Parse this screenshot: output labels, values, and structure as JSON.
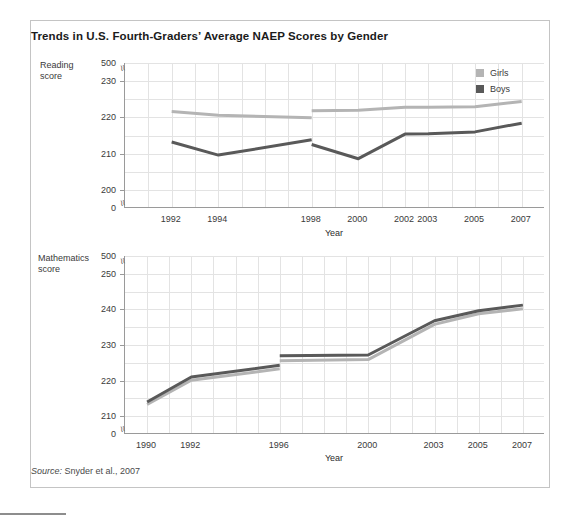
{
  "figure": {
    "title": "Trends in U.S. Fourth-Graders’ Average NAEP Scores by Gender",
    "source_label": "Source:",
    "source_text": " Snyder et al., 2007",
    "colors": {
      "girls": "#b4b4b4",
      "boys": "#595959",
      "grid": "#e3e3e3",
      "axis": "#9a9a9a",
      "frame": "#c4c4c4",
      "text": "#3a3a3a"
    }
  },
  "legend": {
    "position": "top-right",
    "items": [
      {
        "label": "Girls",
        "color": "#b4b4b4"
      },
      {
        "label": "Boys",
        "color": "#595959"
      }
    ]
  },
  "chart_data": [
    {
      "id": "reading",
      "type": "line",
      "title": "",
      "ylabel": "Reading\nscore",
      "xlabel": "Year",
      "axis_break": true,
      "grid": true,
      "ylim": [
        195,
        235
      ],
      "yticks": [
        0,
        200,
        210,
        220,
        230,
        500
      ],
      "ytick_labels": [
        "0",
        "200",
        "210",
        "220",
        "230",
        "500"
      ],
      "xlim": [
        1990,
        2008
      ],
      "xticks": [
        1992,
        1994,
        1998,
        2000,
        2002,
        2003,
        2005,
        2007
      ],
      "xtick_labels": [
        "1992",
        "1994",
        "1998",
        "2000",
        "2002",
        "2003",
        "2005",
        "2007"
      ],
      "series": [
        {
          "name": "Girls",
          "color": "#b4b4b4",
          "segments": [
            {
              "x": [
                1992,
                1994,
                1998
              ],
              "y": [
                221.6,
                220.6,
                219.9
              ]
            },
            {
              "x": [
                1998,
                2000,
                2002,
                2003,
                2005,
                2007
              ],
              "y": [
                221.8,
                222.0,
                222.8,
                222.8,
                222.9,
                224.4
              ]
            }
          ]
        },
        {
          "name": "Boys",
          "color": "#595959",
          "segments": [
            {
              "x": [
                1992,
                1994,
                1998
              ],
              "y": [
                213.2,
                209.6,
                213.8
              ]
            },
            {
              "x": [
                1998,
                2000,
                2002,
                2003,
                2005,
                2007
              ],
              "y": [
                212.5,
                208.6,
                215.4,
                215.5,
                216.0,
                218.4
              ]
            }
          ]
        }
      ]
    },
    {
      "id": "mathematics",
      "type": "line",
      "title": "",
      "ylabel": "Mathematics\nscore",
      "xlabel": "Year",
      "axis_break": true,
      "grid": true,
      "ylim": [
        205,
        255
      ],
      "yticks": [
        0,
        210,
        220,
        230,
        240,
        250,
        500
      ],
      "ytick_labels": [
        "0",
        "210",
        "220",
        "230",
        "240",
        "250",
        "500"
      ],
      "xlim": [
        1989,
        2008
      ],
      "xticks": [
        1990,
        1992,
        1996,
        2000,
        2003,
        2005,
        2007
      ],
      "xtick_labels": [
        "1990",
        "1992",
        "1996",
        "2000",
        "2003",
        "2005",
        "2007"
      ],
      "series": [
        {
          "name": "Girls",
          "color": "#b4b4b4",
          "segments": [
            {
              "x": [
                1990,
                1992,
                1996
              ],
              "y": [
                213.3,
                220.1,
                223.3
              ]
            },
            {
              "x": [
                1996,
                2000,
                2003,
                2005,
                2007
              ],
              "y": [
                225.6,
                225.9,
                235.8,
                238.8,
                240.2
              ]
            }
          ]
        },
        {
          "name": "Boys",
          "color": "#595959",
          "segments": [
            {
              "x": [
                1990,
                1992,
                1996
              ],
              "y": [
                214.0,
                221.0,
                224.3
              ]
            },
            {
              "x": [
                1996,
                2000,
                2003,
                2005,
                2007
              ],
              "y": [
                227.0,
                227.2,
                236.8,
                239.6,
                241.2
              ]
            }
          ]
        }
      ]
    }
  ]
}
